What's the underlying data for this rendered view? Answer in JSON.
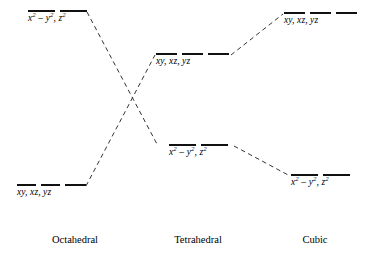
{
  "diagram": {
    "background_color": "#ffffff",
    "line_color": "#111111",
    "dash_color": "#333333",
    "width": 367,
    "height": 264
  },
  "geometries": [
    {
      "key": "octahedral",
      "label": "Octahedral"
    },
    {
      "key": "tetrahedral",
      "label": "Tetrahedral"
    },
    {
      "key": "cubic",
      "label": "Cubic"
    }
  ],
  "levels": {
    "octahedral_upper": {
      "geometry": "Octahedral",
      "set_label": "eg",
      "orbitals_text": "x2 – y2, z2",
      "orbital_parts": [
        {
          "base": "x",
          "exp": "2"
        },
        {
          "base": " – y",
          "exp": "2"
        },
        {
          "base": ", z",
          "exp": "2"
        }
      ],
      "bar_count": 2,
      "energy_rank": "high"
    },
    "octahedral_lower": {
      "geometry": "Octahedral",
      "set_label": "t2g",
      "orbitals_text": "xy, xz, yz",
      "orbital_parts": [
        {
          "base": "xy,",
          "exp": ""
        },
        {
          "base": " xz,",
          "exp": ""
        },
        {
          "base": " yz",
          "exp": ""
        }
      ],
      "bar_count": 3,
      "energy_rank": "low"
    },
    "tetrahedral_upper": {
      "geometry": "Tetrahedral",
      "set_label": "t2",
      "orbitals_text": "xy, xz, yz",
      "bar_count": 3,
      "energy_rank": "high"
    },
    "tetrahedral_lower": {
      "geometry": "Tetrahedral",
      "set_label": "e",
      "orbitals_text": "x2 – y2, z2",
      "bar_count": 2,
      "energy_rank": "low"
    },
    "cubic_upper": {
      "geometry": "Cubic",
      "set_label": "t2",
      "orbitals_text": "xy, xz, yz",
      "bar_count": 3,
      "energy_rank": "high"
    },
    "cubic_lower": {
      "geometry": "Cubic",
      "set_label": "e",
      "orbitals_text": "x2 – y2, z2",
      "bar_count": 2,
      "energy_rank": "low"
    }
  },
  "labels": {
    "xy_xz_yz": "xy,  xz,  yz",
    "octahedral_caption": "Octahedral",
    "tetrahedral_caption": "Tetrahedral",
    "cubic_caption": "Cubic"
  },
  "connectors": [
    {
      "name": "oct-upper-to-tet-lower",
      "from": "octahedral_upper",
      "to": "tetrahedral_lower",
      "style": "dashed"
    },
    {
      "name": "oct-lower-to-tet-upper",
      "from": "octahedral_lower",
      "to": "tetrahedral_upper",
      "style": "dashed"
    },
    {
      "name": "tet-upper-to-cubic-upper",
      "from": "tetrahedral_upper",
      "to": "cubic_upper",
      "style": "dashed"
    },
    {
      "name": "tet-lower-to-cubic-lower",
      "from": "tetrahedral_lower",
      "to": "cubic_lower",
      "style": "dashed"
    }
  ]
}
